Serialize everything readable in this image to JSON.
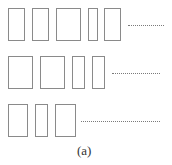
{
  "diagram": {
    "caption": "(a)",
    "colors": {
      "stroke": "#8a8a8a",
      "background": "#ffffff",
      "text": "#333333"
    },
    "rows": [
      {
        "y": 8,
        "height": 33,
        "rects": [
          {
            "x": 8,
            "w": 17
          },
          {
            "x": 32,
            "w": 17
          },
          {
            "x": 56,
            "w": 25
          },
          {
            "x": 88,
            "w": 10
          },
          {
            "x": 104,
            "w": 17
          }
        ],
        "dots": {
          "x": 128,
          "w": 36
        }
      },
      {
        "y": 56,
        "height": 33,
        "rects": [
          {
            "x": 8,
            "w": 25
          },
          {
            "x": 40,
            "w": 25
          },
          {
            "x": 72,
            "w": 13
          },
          {
            "x": 92,
            "w": 13
          }
        ],
        "dots": {
          "x": 112,
          "w": 48
        }
      },
      {
        "y": 104,
        "height": 33,
        "rects": [
          {
            "x": 8,
            "w": 20
          },
          {
            "x": 35,
            "w": 13
          },
          {
            "x": 55,
            "w": 21
          }
        ],
        "dots": {
          "x": 81,
          "w": 79
        }
      }
    ]
  }
}
